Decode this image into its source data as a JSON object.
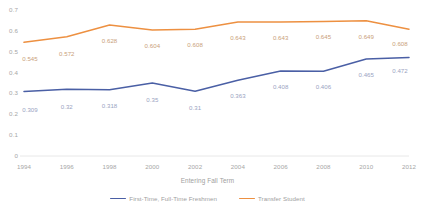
{
  "chart_data": {
    "type": "line",
    "title": "",
    "xlabel": "Entering Fall Term",
    "ylabel": "",
    "categories": [
      "1994",
      "1996",
      "1998",
      "2000",
      "2002",
      "2004",
      "2006",
      "2008",
      "2010",
      "2012"
    ],
    "x": [
      1994,
      1996,
      1998,
      2000,
      2002,
      2004,
      2006,
      2008,
      2010,
      2012
    ],
    "xlim": [
      1994,
      2012
    ],
    "ylim": [
      0,
      0.7
    ],
    "yticks": [
      "0",
      "0.1",
      "0.2",
      "0.3",
      "0.4",
      "0.5",
      "0.6",
      "0.7"
    ],
    "ytick_values": [
      0,
      0.1,
      0.2,
      0.3,
      0.4,
      0.5,
      0.6,
      0.7
    ],
    "grid": false,
    "legend_position": "bottom",
    "series": [
      {
        "name": "First-Time, Full-Time Freshmen",
        "color": "#4a5fa5",
        "label_color": "#9aa3bf",
        "values": [
          0.309,
          0.32,
          0.318,
          0.35,
          0.31,
          0.363,
          0.408,
          0.406,
          0.465,
          0.472
        ],
        "labels": [
          "0.309",
          "0.32",
          "0.318",
          "0.35",
          "0.31",
          "0.363",
          "0.408",
          "0.406",
          "0.465",
          "0.472"
        ]
      },
      {
        "name": "Transfer Student",
        "color": "#ed9041",
        "label_color": "#c9a07a",
        "values": [
          0.545,
          0.572,
          0.628,
          0.604,
          0.608,
          0.643,
          0.643,
          0.645,
          0.649,
          0.608
        ],
        "labels": [
          "0.545",
          "0.572",
          "0.628",
          "0.604",
          "0.608",
          "0.643",
          "0.643",
          "0.645",
          "0.649",
          "0.608"
        ]
      }
    ]
  }
}
